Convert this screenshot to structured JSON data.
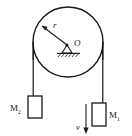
{
  "figure": {
    "type": "physics-diagram",
    "stroke_color": "#1a1a1a",
    "background_color": "#ffffff"
  },
  "pulley": {
    "name": "pulley-wheel",
    "center_label": "O",
    "radius_label": "r",
    "center_x": 68,
    "center_y": 42,
    "radius": 35
  },
  "support": {
    "name": "pivot-support",
    "hatching": true
  },
  "masses": [
    {
      "id": "left",
      "label": "M",
      "subscript": "2",
      "x": 28,
      "y": 96,
      "width": 14,
      "height": 22
    },
    {
      "id": "right",
      "label": "M",
      "subscript": "1",
      "x": 92,
      "y": 103,
      "width": 14,
      "height": 23
    }
  ],
  "velocity": {
    "name": "velocity-arrow",
    "label": "v",
    "direction": "down"
  }
}
